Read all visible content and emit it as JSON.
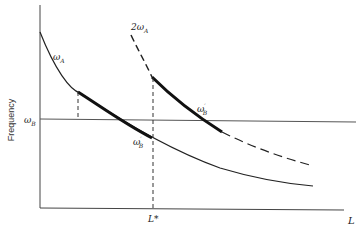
{
  "diagram": {
    "y_axis_label": "Frequency",
    "x_axis_label": "L",
    "curves": [
      {
        "id": "omega_A",
        "label": "ω",
        "subscript": "A",
        "style": "solid"
      },
      {
        "id": "two_omega_A",
        "label": "2ω",
        "subscript": "A",
        "style": "dashed-then-bold"
      }
    ],
    "horizontal_line": {
      "label": "ω",
      "subscript": "B"
    },
    "points": [
      {
        "label": "ω",
        "subscript": "B",
        "prime": "′"
      },
      {
        "label": "ω",
        "subscript": "B",
        "prime": "′"
      }
    ],
    "l_star_label": "L*",
    "colors": {
      "ink": "#222222",
      "axis": "#444444"
    }
  }
}
